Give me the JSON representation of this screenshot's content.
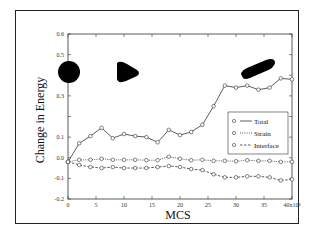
{
  "chart_data": {
    "type": "line",
    "title": "",
    "xlabel": "MCS",
    "ylabel": "Change in Energy",
    "x_tick_labels": [
      "0",
      "5",
      "10",
      "15",
      "20",
      "25",
      "30",
      "35",
      "40x10⁴"
    ],
    "y_tick_labels": [
      "-0.2",
      "-0.1",
      "0.0",
      "0.1",
      "0.3",
      "0.5",
      "0.6"
    ],
    "xlim": [
      0,
      40
    ],
    "ylim": [
      -0.2,
      0.6
    ],
    "x_unit_multiplier": "x10^4",
    "grid": false,
    "legend_position": "lower-right inside",
    "x": [
      0,
      2,
      4,
      6,
      8,
      10,
      12,
      14,
      16,
      18,
      20,
      22,
      24,
      26,
      28,
      30,
      32,
      34,
      36,
      38,
      40
    ],
    "series": [
      {
        "name": "Total",
        "line_style": "solid",
        "marker": "open-circle",
        "values": [
          -0.02,
          0.07,
          0.105,
          0.145,
          0.095,
          0.115,
          0.105,
          0.1,
          0.075,
          0.135,
          0.11,
          0.125,
          0.16,
          0.25,
          0.35,
          0.34,
          0.35,
          0.33,
          0.34,
          0.385,
          0.38
        ]
      },
      {
        "name": "Strain",
        "line_style": "dotted",
        "marker": "open-circle",
        "values": [
          -0.02,
          -0.01,
          -0.01,
          -0.005,
          -0.01,
          -0.01,
          -0.01,
          -0.012,
          -0.012,
          0.005,
          -0.005,
          -0.012,
          -0.01,
          -0.015,
          -0.015,
          -0.017,
          -0.012,
          -0.015,
          -0.015,
          -0.02,
          -0.02
        ]
      },
      {
        "name": "Interface",
        "line_style": "dashed",
        "marker": "open-circle",
        "values": [
          -0.02,
          -0.035,
          -0.045,
          -0.05,
          -0.045,
          -0.05,
          -0.05,
          -0.05,
          -0.045,
          -0.04,
          -0.045,
          -0.055,
          -0.06,
          -0.08,
          -0.095,
          -0.095,
          -0.09,
          -0.09,
          -0.095,
          -0.11,
          -0.105
        ]
      }
    ],
    "annotations": [
      {
        "type": "shape",
        "shape": "circle",
        "position": "top-left",
        "fill": "#000000"
      },
      {
        "type": "shape",
        "shape": "rounded-triangle",
        "position": "top-left-center",
        "fill": "#000000"
      },
      {
        "type": "shape",
        "shape": "elongated-ellipse",
        "position": "top-right",
        "fill": "#000000"
      }
    ]
  },
  "colors": {
    "line": "#333333",
    "shape_fill": "#000000",
    "background": "#ffffff"
  }
}
